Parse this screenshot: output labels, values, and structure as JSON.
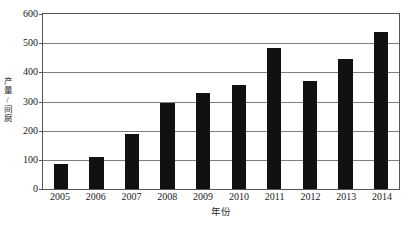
{
  "chart_data": {
    "type": "bar",
    "title": "",
    "xlabel": "年份",
    "ylabel": "产量/间腐",
    "categories": [
      "2005",
      "2006",
      "2007",
      "2008",
      "2009",
      "2010",
      "2011",
      "2012",
      "2013",
      "2014"
    ],
    "values": [
      85,
      110,
      190,
      295,
      330,
      355,
      483,
      370,
      445,
      540
    ],
    "ylim": [
      0,
      600
    ],
    "yticks": [
      0,
      100,
      200,
      300,
      400,
      500,
      600
    ],
    "ytick_labels": [
      "0",
      "100",
      "200",
      "300",
      "400",
      "500",
      "600"
    ],
    "grid": true,
    "grid_axis": "y",
    "legend": false,
    "legend_position": "none",
    "bar_color": "#111111",
    "gridline_color": "#7d7d7d",
    "frame_color": "#555555",
    "background_color": "#ffffff"
  }
}
